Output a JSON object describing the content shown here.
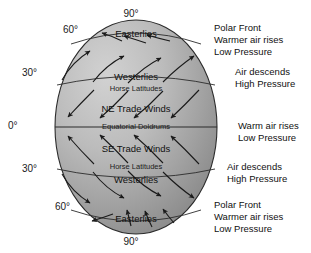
{
  "diagram": {
    "type": "earth-wind-belts",
    "globe": {
      "fill_light": "#c9c9c9",
      "fill_dark": "#8f8f8f",
      "outline": "#2b2b2b"
    },
    "latitude_labels": [
      {
        "id": "north-pole",
        "text": "90°",
        "x": 131,
        "y": 8,
        "align": "center"
      },
      {
        "id": "north-60",
        "text": "60°",
        "x": 63,
        "y": 24,
        "align": "left"
      },
      {
        "id": "north-30",
        "text": "30°",
        "x": 22,
        "y": 67,
        "align": "left"
      },
      {
        "id": "equator",
        "text": "0°",
        "x": 8,
        "y": 120,
        "align": "left"
      },
      {
        "id": "south-30",
        "text": "30°",
        "x": 22,
        "y": 163,
        "align": "left"
      },
      {
        "id": "south-60",
        "text": "60°",
        "x": 55,
        "y": 201,
        "align": "left"
      },
      {
        "id": "south-pole",
        "text": "90°",
        "x": 131,
        "y": 236,
        "align": "center"
      }
    ],
    "wind_bands": [
      {
        "id": "polar-easterlies-north",
        "label": "Easterlies",
        "x": 136,
        "y": 28,
        "sub": false,
        "direction": "westward"
      },
      {
        "id": "westerlies-north",
        "label": "Westerlies",
        "x": 136,
        "y": 71,
        "sub": false,
        "direction": "eastward"
      },
      {
        "id": "horse-latitudes-north",
        "label": "Horse Latitudes",
        "x": 136,
        "y": 84,
        "sub": true,
        "direction": "none"
      },
      {
        "id": "ne-trade-winds",
        "label": "NE Trade Winds",
        "x": 136,
        "y": 103,
        "sub": false,
        "direction": "westward"
      },
      {
        "id": "equatorial-doldrums",
        "label": "Equatorial Doldrums",
        "x": 136,
        "y": 122,
        "sub": true,
        "direction": "none"
      },
      {
        "id": "se-trade-winds",
        "label": "SE Trade Winds",
        "x": 136,
        "y": 143,
        "sub": false,
        "direction": "westward"
      },
      {
        "id": "horse-latitudes-south",
        "label": "Horse Latitudes",
        "x": 136,
        "y": 162,
        "sub": true,
        "direction": "none"
      },
      {
        "id": "westerlies-south",
        "label": "Westerlies",
        "x": 136,
        "y": 174,
        "sub": false,
        "direction": "eastward"
      },
      {
        "id": "polar-easterlies-south",
        "label": "Easterlies",
        "x": 136,
        "y": 213,
        "sub": false,
        "direction": "westward"
      }
    ],
    "annotations": [
      {
        "id": "north-polar-front",
        "x": 214,
        "y": 22,
        "lines": [
          "Polar Front",
          "Warmer air rises",
          "Low Pressure"
        ]
      },
      {
        "id": "north-subtropical-high",
        "x": 235,
        "y": 66,
        "lines": [
          "Air descends",
          "High Pressure"
        ]
      },
      {
        "id": "equatorial-low",
        "x": 238,
        "y": 120,
        "lines": [
          "Warm air rises",
          "Low Pressure"
        ]
      },
      {
        "id": "south-subtropical-high",
        "x": 227,
        "y": 161,
        "lines": [
          "Air descends",
          "High Pressure"
        ]
      },
      {
        "id": "south-polar-front",
        "x": 214,
        "y": 199,
        "lines": [
          "Polar Front",
          "Warmer air rises",
          "Low Pressure"
        ]
      }
    ]
  }
}
